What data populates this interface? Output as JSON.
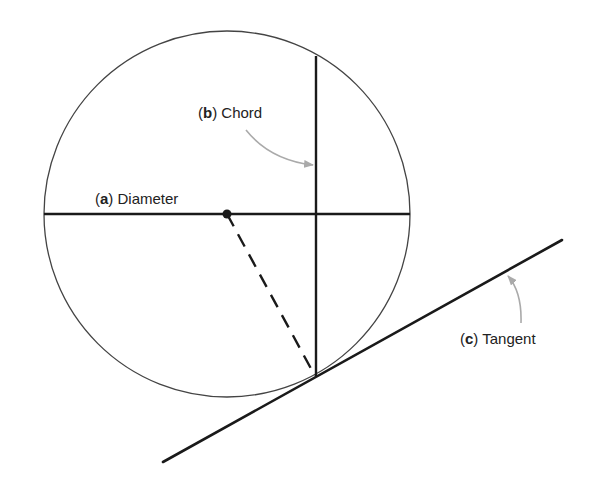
{
  "diagram": {
    "title": "",
    "labels": {
      "diameter": {
        "letter": "a",
        "text": "Diameter"
      },
      "chord": {
        "letter": "b",
        "text": "Chord"
      },
      "tangent": {
        "letter": "c",
        "text": "Tangent"
      }
    },
    "colors": {
      "line": "#1a1a1a",
      "circle": "#444444",
      "arrow": "#aaaaaa",
      "text": "#222222"
    },
    "geometry": {
      "circle": {
        "cx": 227,
        "cy": 214,
        "r": 183
      },
      "diameter": {
        "x1": 44,
        "y1": 214,
        "x2": 410,
        "y2": 214
      },
      "chord": {
        "x1": 316,
        "y1": 56,
        "x2": 316,
        "y2": 376
      },
      "radius_dashed": {
        "x1": 227,
        "y1": 214,
        "x2": 315,
        "y2": 376
      },
      "tangent": {
        "x1": 163,
        "y1": 462,
        "x2": 562,
        "y2": 240
      }
    }
  }
}
